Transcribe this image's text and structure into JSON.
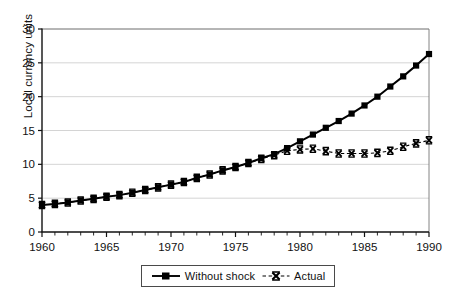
{
  "chart_data": {
    "type": "line",
    "title": "",
    "subtitle": "",
    "xlabel": "",
    "ylabel": "Local currency units",
    "xlim": [
      1960,
      1990
    ],
    "ylim": [
      0,
      30
    ],
    "yticks": [
      0,
      5,
      10,
      15,
      20,
      25,
      30
    ],
    "ytick_labels": [
      "0",
      "5",
      "10",
      "15",
      "20",
      "25",
      "30"
    ],
    "xticks": [
      1960,
      1965,
      1970,
      1975,
      1980,
      1985,
      1990
    ],
    "xtick_labels": [
      "1960",
      "1965",
      "1970",
      "1975",
      "1980",
      "1985",
      "1990"
    ],
    "x_minor_tick_interval": 1,
    "grid": "horizontal-major-only",
    "grid_color": "#c9c9c9",
    "legend_position": "bottom-center",
    "x": [
      1960,
      1961,
      1962,
      1963,
      1964,
      1965,
      1966,
      1967,
      1968,
      1969,
      1970,
      1971,
      1972,
      1973,
      1974,
      1975,
      1976,
      1977,
      1978,
      1979,
      1980,
      1981,
      1982,
      1983,
      1984,
      1985,
      1986,
      1987,
      1988,
      1989,
      1990
    ],
    "series": [
      {
        "name": "Without shock",
        "marker": "filled-square",
        "line_style": "solid",
        "color": "#000000",
        "values": [
          4.0,
          4.15,
          4.35,
          4.65,
          4.9,
          5.2,
          5.45,
          5.8,
          6.2,
          6.6,
          7.0,
          7.4,
          8.0,
          8.5,
          9.1,
          9.6,
          10.2,
          10.9,
          11.5,
          12.4,
          13.4,
          14.4,
          15.4,
          16.4,
          17.5,
          18.7,
          20.0,
          21.5,
          23.0,
          24.6,
          26.3
        ]
      },
      {
        "name": "Actual",
        "marker": "x-bowtie",
        "line_style": "dashed",
        "color": "#000000",
        "values": [
          4.0,
          4.15,
          4.35,
          4.65,
          4.9,
          5.2,
          5.45,
          5.8,
          6.2,
          6.6,
          7.0,
          7.4,
          8.0,
          8.5,
          9.1,
          9.6,
          10.2,
          10.8,
          11.35,
          12.0,
          12.2,
          12.3,
          11.95,
          11.6,
          11.6,
          11.6,
          11.7,
          12.0,
          12.6,
          13.1,
          13.55
        ]
      }
    ]
  },
  "legend": {
    "items": [
      {
        "label": "Without shock",
        "marker": "filled-square-icon"
      },
      {
        "label": "Actual",
        "marker": "x-bowtie-icon"
      }
    ]
  }
}
